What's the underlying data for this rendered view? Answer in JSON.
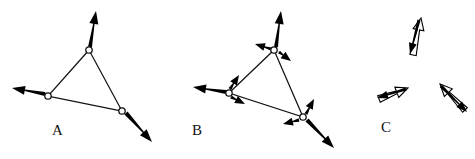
{
  "figure": {
    "title": "",
    "background_color": "#ffffff",
    "ink_color": "#000000",
    "width": 475,
    "height": 159,
    "panels": [
      {
        "id": "A",
        "label": "A",
        "label_pos": [
          52,
          135
        ],
        "show_triangle": true,
        "show_nodes": true,
        "description": "Triangle of three nodes, each with one large outward velocity vector",
        "nodes": [
          {
            "name": "apex",
            "x": 89,
            "y": 50
          },
          {
            "name": "left",
            "x": 48,
            "y": 96
          },
          {
            "name": "lower-right",
            "x": 122,
            "y": 111
          }
        ],
        "vectors": [
          {
            "name": "apex-main",
            "style": "solid",
            "x1": 90,
            "y1": 47,
            "x2": 96,
            "y2": 11,
            "width": 4.0,
            "head_len": 13,
            "head_w": 9
          },
          {
            "name": "left-main",
            "style": "solid",
            "x1": 45,
            "y1": 94,
            "x2": 12,
            "y2": 88,
            "width": 4.0,
            "head_len": 13,
            "head_w": 9
          },
          {
            "name": "lower-right-main",
            "style": "solid",
            "x1": 126,
            "y1": 113,
            "x2": 152,
            "y2": 142,
            "width": 4.2,
            "head_len": 13,
            "head_w": 9
          }
        ]
      },
      {
        "id": "B",
        "label": "B",
        "label_pos": [
          192,
          135
        ],
        "show_triangle": true,
        "show_nodes": true,
        "description": "Same triangle with large outward vectors plus two small tangential vectors per node",
        "nodes": [
          {
            "name": "apex",
            "x": 274,
            "y": 50
          },
          {
            "name": "left",
            "x": 229,
            "y": 93
          },
          {
            "name": "lower-right",
            "x": 303,
            "y": 117
          }
        ],
        "vectors": [
          {
            "name": "apex-main",
            "style": "solid",
            "x1": 276,
            "y1": 47,
            "x2": 281,
            "y2": 11,
            "width": 4.0,
            "head_len": 13,
            "head_w": 9
          },
          {
            "name": "apex-small-left",
            "style": "solid",
            "x1": 271,
            "y1": 49,
            "x2": 255,
            "y2": 44,
            "width": 3.4,
            "head_len": 10,
            "head_w": 8
          },
          {
            "name": "apex-small-right",
            "style": "solid",
            "x1": 279,
            "y1": 52,
            "x2": 291,
            "y2": 61,
            "width": 3.4,
            "head_len": 10,
            "head_w": 8
          },
          {
            "name": "left-main",
            "style": "solid",
            "x1": 226,
            "y1": 92,
            "x2": 193,
            "y2": 87,
            "width": 4.0,
            "head_len": 13,
            "head_w": 9
          },
          {
            "name": "left-small-up",
            "style": "solid",
            "x1": 230,
            "y1": 89,
            "x2": 239,
            "y2": 75,
            "width": 3.4,
            "head_len": 10,
            "head_w": 8
          },
          {
            "name": "left-small-down",
            "style": "solid",
            "x1": 231,
            "y1": 97,
            "x2": 245,
            "y2": 104,
            "width": 3.4,
            "head_len": 10,
            "head_w": 8
          },
          {
            "name": "lower-right-main",
            "style": "solid",
            "x1": 307,
            "y1": 120,
            "x2": 334,
            "y2": 148,
            "width": 4.2,
            "head_len": 13,
            "head_w": 9
          },
          {
            "name": "lower-right-small-up",
            "style": "solid",
            "x1": 306,
            "y1": 114,
            "x2": 314,
            "y2": 99,
            "width": 3.4,
            "head_len": 10,
            "head_w": 8
          },
          {
            "name": "lower-right-small-left",
            "style": "solid",
            "x1": 299,
            "y1": 120,
            "x2": 283,
            "y2": 124,
            "width": 3.4,
            "head_len": 10,
            "head_w": 8
          }
        ]
      },
      {
        "id": "C",
        "label": "C",
        "label_pos": [
          381,
          132
        ],
        "show_triangle": false,
        "show_nodes": false,
        "description": "Three detached vector pairs, each an open outline arrow paired with a solid arrow",
        "nodes": [],
        "vectors": [
          {
            "name": "top-pair-open",
            "style": "open",
            "x1": 413,
            "y1": 55,
            "x2": 421,
            "y2": 18,
            "width": 6.5,
            "head_len": 12,
            "head_w": 11
          },
          {
            "name": "top-pair-solid",
            "style": "solid",
            "x1": 419,
            "y1": 20,
            "x2": 410,
            "y2": 54,
            "width": 3.2,
            "head_len": 11,
            "head_w": 8
          },
          {
            "name": "left-pair-open",
            "style": "open",
            "x1": 379,
            "y1": 99,
            "x2": 408,
            "y2": 88,
            "width": 7.0,
            "head_len": 12,
            "head_w": 11
          },
          {
            "name": "left-pair-solid",
            "style": "solid",
            "x1": 406,
            "y1": 89,
            "x2": 377,
            "y2": 98,
            "width": 3.2,
            "head_len": 11,
            "head_w": 8
          },
          {
            "name": "right-pair-open",
            "style": "open",
            "x1": 465,
            "y1": 110,
            "x2": 440,
            "y2": 84,
            "width": 6.5,
            "head_len": 12,
            "head_w": 11
          },
          {
            "name": "right-pair-solid",
            "style": "solid",
            "x1": 441,
            "y1": 86,
            "x2": 467,
            "y2": 112,
            "width": 3.2,
            "head_len": 11,
            "head_w": 8
          }
        ]
      }
    ]
  }
}
